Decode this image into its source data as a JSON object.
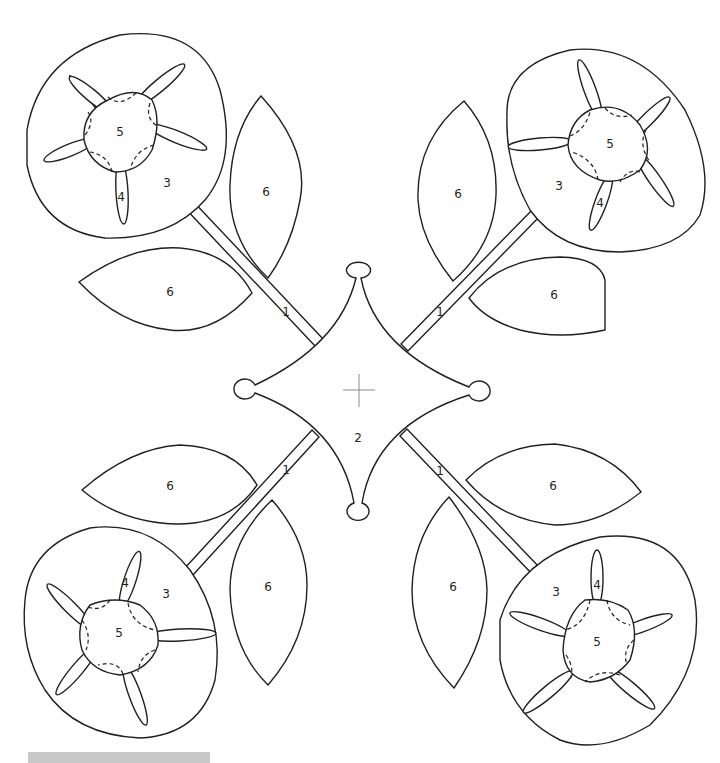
{
  "diagram": {
    "pieces": {
      "stem": "1",
      "center": "2",
      "flower_back": "3",
      "petal": "4",
      "flower_center": "5",
      "leaf": "6"
    },
    "labels": {
      "center_label": "2",
      "stem_tl": "1",
      "stem_tr": "1",
      "stem_bl": "1",
      "stem_br": "1",
      "flower_tl": {
        "back": "3",
        "petal": "4",
        "center": "5"
      },
      "flower_tr": {
        "back": "3",
        "petal": "4",
        "center": "5"
      },
      "flower_bl": {
        "back": "3",
        "petal": "4",
        "center": "5"
      },
      "flower_br": {
        "back": "3",
        "petal": "4",
        "center": "5"
      },
      "leaf_tl_a": "6",
      "leaf_tl_b": "6",
      "leaf_tr_a": "6",
      "leaf_tr_b": "6",
      "leaf_bl_a": "6",
      "leaf_bl_b": "6",
      "leaf_br_a": "6",
      "leaf_br_b": "6"
    },
    "colors": {
      "line": "#231f20",
      "registration_cross": "#8a8a8a",
      "footer_bar": "#c8c8c8"
    }
  }
}
